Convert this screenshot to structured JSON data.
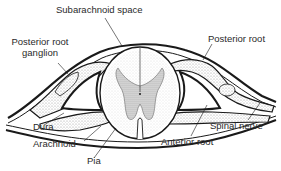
{
  "diagram": {
    "type": "anatomical cross-section",
    "labels": {
      "subarachnoid_space": "Subarachnoid space",
      "posterior_root_ganglion_line1": "Posterior root",
      "posterior_root_ganglion_line2": "ganglion",
      "posterior_root": "Posterior root",
      "dura": "Dura",
      "arachnoid": "Arachnoid",
      "pia": "Pia",
      "anterior_root": "Anterior root",
      "spinal_nerve": "Spinal nerve"
    },
    "colors": {
      "line": "#1a1a1a",
      "stipple": "#c8c8c8",
      "background": "#ffffff"
    }
  }
}
